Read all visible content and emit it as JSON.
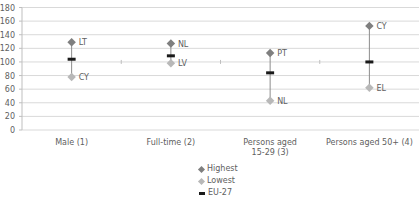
{
  "chart_data": {
    "type": "scatter",
    "subtype": "high-low-marker",
    "title": "",
    "xlabel": "",
    "ylabel": "",
    "ylim": [
      0,
      180
    ],
    "yticks": [
      0,
      20,
      40,
      60,
      80,
      100,
      120,
      140,
      160,
      180
    ],
    "grid": true,
    "legend_position": "bottom",
    "categories": [
      "Male (1)",
      "Full-time (2)",
      "Persons aged 15-29 (3)",
      "Persons aged 50+ (4)"
    ],
    "category_lines": [
      [
        "Male (1)"
      ],
      [
        "Full-time (2)"
      ],
      [
        "Persons aged",
        "15-29 (3)"
      ],
      [
        "Persons aged 50+ (4)"
      ]
    ],
    "series": [
      {
        "name": "Highest",
        "color": "#7f7f7f",
        "marker": "diamond",
        "values": [
          129,
          127,
          113,
          153
        ],
        "labels": [
          "LT",
          "NL",
          "PT",
          "CY"
        ]
      },
      {
        "name": "Lowest",
        "color": "#b8b8b8",
        "marker": "diamond",
        "values": [
          78,
          98,
          43,
          62
        ],
        "labels": [
          "CY",
          "LV",
          "NL",
          "EL"
        ]
      },
      {
        "name": "EU-27",
        "color": "#1a1a1a",
        "marker": "dash",
        "values": [
          104,
          109,
          84,
          100
        ],
        "labels": [
          "",
          "",
          "",
          ""
        ]
      }
    ]
  },
  "legend": {
    "items": [
      {
        "label": "Highest",
        "color": "#7f7f7f"
      },
      {
        "label": "Lowest",
        "color": "#b8b8b8"
      },
      {
        "label": "EU-27",
        "color": "#1a1a1a"
      }
    ]
  }
}
